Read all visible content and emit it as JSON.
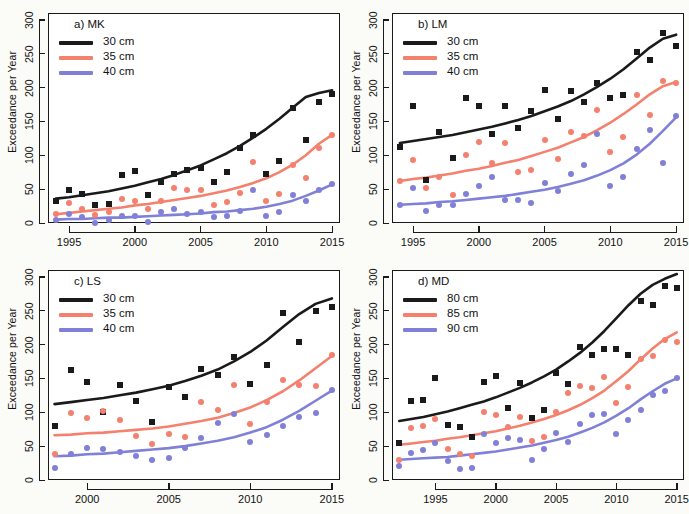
{
  "figure": {
    "ylabel": "Exceedance per Year",
    "colors": {
      "black": "#1a1a1a",
      "red": "#f4806e",
      "blue": "#8080d8"
    }
  },
  "chart_data": [
    {
      "type": "scatter",
      "panel": "a",
      "title": "a) MK",
      "xlabel": "",
      "ylabel": "Exceedance per Year",
      "xlim": [
        1993.4,
        2015.6
      ],
      "ylim": [
        0,
        310
      ],
      "xticks": [
        1995,
        2000,
        2005,
        2010,
        2015
      ],
      "yticks": [
        0,
        50,
        100,
        150,
        200,
        250,
        300
      ],
      "grid": false,
      "legend_position": "top-left",
      "series": [
        {
          "name": "30 cm",
          "color": "#1a1a1a",
          "marker": "square",
          "x": [
            1994,
            1995,
            1996,
            1997,
            1998,
            1999,
            2000,
            2001,
            2002,
            2003,
            2004,
            2005,
            2006,
            2007,
            2008,
            2009,
            2010,
            2011,
            2012,
            2013,
            2014,
            2015
          ],
          "values": [
            33,
            48,
            43,
            26,
            28,
            71,
            77,
            42,
            61,
            72,
            78,
            81,
            61,
            76,
            111,
            130,
            73,
            91,
            170,
            122,
            178,
            190
          ],
          "fit": [
            36,
            38,
            41,
            44,
            47,
            51,
            55,
            60,
            65,
            71,
            78,
            85,
            94,
            103,
            114,
            126,
            139,
            154,
            170,
            186,
            192,
            196
          ]
        },
        {
          "name": "35 cm",
          "color": "#f4806e",
          "marker": "circle",
          "x": [
            1994,
            1995,
            1996,
            1997,
            1998,
            1999,
            2000,
            2001,
            2002,
            2003,
            2004,
            2005,
            2006,
            2007,
            2008,
            2009,
            2010,
            2011,
            2012,
            2013,
            2014,
            2015
          ],
          "values": [
            13,
            30,
            21,
            12,
            16,
            35,
            32,
            20,
            33,
            51,
            49,
            48,
            27,
            31,
            45,
            90,
            32,
            43,
            86,
            67,
            110,
            130
          ],
          "fit": [
            13,
            15,
            17,
            19,
            21,
            23,
            26,
            28,
            31,
            34,
            37,
            40,
            44,
            48,
            53,
            59,
            66,
            75,
            86,
            100,
            117,
            130
          ]
        },
        {
          "name": "40 cm",
          "color": "#8080d8",
          "marker": "circle",
          "x": [
            1994,
            1995,
            1996,
            1997,
            1998,
            1999,
            2000,
            2001,
            2002,
            2003,
            2004,
            2005,
            2006,
            2007,
            2008,
            2009,
            2010,
            2011,
            2012,
            2013,
            2014,
            2015
          ],
          "values": [
            5,
            14,
            9,
            0,
            5,
            11,
            11,
            2,
            16,
            21,
            14,
            16,
            9,
            10,
            18,
            48,
            11,
            16,
            42,
            33,
            48,
            58
          ],
          "fit": [
            5,
            6,
            6,
            7,
            8,
            8,
            9,
            10,
            11,
            12,
            13,
            14,
            16,
            17,
            19,
            21,
            24,
            28,
            33,
            40,
            48,
            57
          ]
        }
      ]
    },
    {
      "type": "scatter",
      "panel": "b",
      "title": "b) LM",
      "xlabel": "",
      "ylabel": "Exceedance per Year",
      "xlim": [
        1993.4,
        2015.6
      ],
      "ylim": [
        0,
        310
      ],
      "xticks": [
        1995,
        2000,
        2005,
        2010,
        2015
      ],
      "yticks": [
        0,
        50,
        100,
        150,
        200,
        250,
        300
      ],
      "grid": false,
      "legend_position": "top-left",
      "series": [
        {
          "name": "30 cm",
          "color": "#1a1a1a",
          "marker": "square",
          "x": [
            1994,
            1995,
            1996,
            1997,
            1998,
            1999,
            2000,
            2001,
            2002,
            2003,
            2004,
            2005,
            2006,
            2007,
            2008,
            2009,
            2010,
            2011,
            2012,
            2013,
            2014,
            2015
          ],
          "values": [
            112,
            172,
            64,
            135,
            96,
            184,
            172,
            132,
            173,
            140,
            165,
            196,
            154,
            195,
            178,
            206,
            185,
            189,
            253,
            241,
            281,
            262
          ],
          "fit": [
            118,
            121,
            124,
            127,
            130,
            134,
            138,
            142,
            147,
            152,
            158,
            165,
            172,
            180,
            190,
            201,
            213,
            227,
            243,
            259,
            272,
            278
          ]
        },
        {
          "name": "35 cm",
          "color": "#f4806e",
          "marker": "circle",
          "x": [
            1994,
            1995,
            1996,
            1997,
            1998,
            1999,
            2000,
            2001,
            2002,
            2003,
            2004,
            2005,
            2006,
            2007,
            2008,
            2009,
            2010,
            2011,
            2012,
            2013,
            2014,
            2015
          ],
          "values": [
            62,
            93,
            52,
            68,
            42,
            101,
            120,
            89,
            118,
            75,
            78,
            122,
            94,
            134,
            129,
            167,
            105,
            127,
            189,
            160,
            209,
            207
          ],
          "fit": [
            62,
            65,
            67,
            70,
            73,
            77,
            80,
            84,
            89,
            93,
            99,
            105,
            111,
            119,
            127,
            137,
            148,
            161,
            175,
            190,
            202,
            208
          ]
        },
        {
          "name": "40 cm",
          "color": "#8080d8",
          "marker": "circle",
          "x": [
            1994,
            1995,
            1996,
            1997,
            1998,
            1999,
            2000,
            2001,
            2002,
            2003,
            2004,
            2005,
            2006,
            2007,
            2008,
            2009,
            2010,
            2011,
            2012,
            2013,
            2014,
            2015
          ],
          "values": [
            27,
            52,
            18,
            27,
            27,
            43,
            54,
            68,
            34,
            34,
            29,
            59,
            47,
            72,
            86,
            131,
            54,
            68,
            109,
            138,
            89,
            158
          ],
          "fit": [
            27,
            28,
            29,
            31,
            32,
            34,
            36,
            38,
            40,
            43,
            46,
            49,
            53,
            58,
            63,
            70,
            78,
            88,
            101,
            117,
            136,
            156
          ]
        }
      ]
    },
    {
      "type": "scatter",
      "panel": "c",
      "title": "c) LS",
      "xlabel": "",
      "ylabel": "Exceedance per Year",
      "xlim": [
        1997.6,
        2015.5
      ],
      "ylim": [
        0,
        310
      ],
      "xticks": [
        2000,
        2005,
        2010,
        2015
      ],
      "yticks": [
        0,
        50,
        100,
        150,
        200,
        250,
        300
      ],
      "grid": false,
      "legend_position": "top-left",
      "series": [
        {
          "name": "30 cm",
          "color": "#1a1a1a",
          "marker": "square",
          "x": [
            1998,
            1999,
            2000,
            2001,
            2002,
            2003,
            2004,
            2005,
            2006,
            2007,
            2008,
            2009,
            2010,
            2011,
            2012,
            2013,
            2014,
            2015
          ],
          "values": [
            80,
            163,
            145,
            101,
            140,
            117,
            85,
            137,
            123,
            164,
            155,
            181,
            142,
            170,
            247,
            203,
            249,
            255
          ],
          "fit": [
            112,
            115,
            118,
            121,
            125,
            129,
            134,
            139,
            146,
            154,
            163,
            175,
            189,
            206,
            226,
            245,
            260,
            268
          ]
        },
        {
          "name": "35 cm",
          "color": "#f4806e",
          "marker": "circle",
          "x": [
            1998,
            1999,
            2000,
            2001,
            2002,
            2003,
            2004,
            2005,
            2006,
            2007,
            2008,
            2009,
            2010,
            2011,
            2012,
            2013,
            2014,
            2015
          ],
          "values": [
            39,
            99,
            92,
            102,
            88,
            65,
            53,
            68,
            63,
            115,
            104,
            140,
            82,
            115,
            148,
            140,
            139,
            185
          ],
          "fit": [
            66,
            67,
            69,
            70,
            72,
            74,
            76,
            79,
            83,
            87,
            92,
            99,
            107,
            118,
            131,
            147,
            165,
            183
          ]
        },
        {
          "name": "40 cm",
          "color": "#8080d8",
          "marker": "circle",
          "x": [
            1998,
            1999,
            2000,
            2001,
            2002,
            2003,
            2004,
            2005,
            2006,
            2007,
            2008,
            2009,
            2010,
            2011,
            2012,
            2013,
            2014,
            2015
          ],
          "values": [
            17,
            39,
            47,
            46,
            41,
            35,
            29,
            33,
            47,
            62,
            84,
            97,
            56,
            66,
            79,
            93,
            99,
            133
          ],
          "fit": [
            35,
            36,
            38,
            39,
            41,
            43,
            45,
            47,
            50,
            54,
            58,
            63,
            70,
            78,
            89,
            102,
            117,
            132
          ]
        }
      ]
    },
    {
      "type": "scatter",
      "panel": "d",
      "title": "d) MD",
      "xlabel": "",
      "ylabel": "Exceedance per Year",
      "xlim": [
        1991.4,
        2015.6
      ],
      "ylim": [
        0,
        310
      ],
      "xticks": [
        1995,
        2000,
        2005,
        2010,
        2015
      ],
      "yticks": [
        0,
        50,
        100,
        150,
        200,
        250,
        300
      ],
      "grid": false,
      "legend_position": "top-left",
      "series": [
        {
          "name": "80 cm",
          "color": "#1a1a1a",
          "marker": "square",
          "x": [
            1992,
            1993,
            1994,
            1995,
            1996,
            1997,
            1998,
            1999,
            2000,
            2001,
            2002,
            2003,
            2004,
            2005,
            2006,
            2007,
            2008,
            2009,
            2010,
            2011,
            2012,
            2013,
            2014,
            2015
          ],
          "values": [
            55,
            116,
            118,
            150,
            81,
            78,
            64,
            145,
            154,
            107,
            143,
            92,
            104,
            158,
            141,
            197,
            185,
            194,
            194,
            184,
            264,
            258,
            286,
            284
          ],
          "fit": [
            87,
            90,
            93,
            97,
            101,
            106,
            111,
            116,
            122,
            129,
            136,
            144,
            153,
            163,
            175,
            188,
            203,
            220,
            239,
            258,
            275,
            288,
            297,
            304
          ]
        },
        {
          "name": "85 cm",
          "color": "#f4806e",
          "marker": "circle",
          "x": [
            1992,
            1993,
            1994,
            1995,
            1996,
            1997,
            1998,
            1999,
            2000,
            2001,
            2002,
            2003,
            2004,
            2005,
            2006,
            2007,
            2008,
            2009,
            2010,
            2011,
            2012,
            2013,
            2014,
            2015
          ],
          "values": [
            30,
            77,
            79,
            90,
            46,
            38,
            35,
            100,
            96,
            78,
            93,
            58,
            64,
            101,
            128,
            139,
            136,
            152,
            113,
            138,
            179,
            183,
            207,
            204
          ],
          "fit": [
            52,
            54,
            56,
            58,
            61,
            63,
            66,
            69,
            72,
            76,
            80,
            85,
            90,
            96,
            103,
            111,
            121,
            132,
            146,
            161,
            178,
            194,
            208,
            218
          ]
        },
        {
          "name": "90 cm",
          "color": "#8080d8",
          "marker": "circle",
          "x": [
            1992,
            1993,
            1994,
            1995,
            1996,
            1997,
            1998,
            1999,
            2000,
            2001,
            2002,
            2003,
            2004,
            2005,
            2006,
            2007,
            2008,
            2009,
            2010,
            2011,
            2012,
            2013,
            2014,
            2015
          ],
          "values": [
            20,
            40,
            44,
            55,
            28,
            16,
            17,
            68,
            55,
            62,
            59,
            30,
            46,
            69,
            56,
            83,
            96,
            98,
            68,
            88,
            103,
            126,
            131,
            150
          ],
          "fit": [
            30,
            31,
            32,
            33,
            34,
            36,
            38,
            40,
            42,
            45,
            48,
            51,
            55,
            59,
            64,
            70,
            77,
            85,
            95,
            106,
            119,
            131,
            142,
            150
          ]
        }
      ]
    }
  ]
}
